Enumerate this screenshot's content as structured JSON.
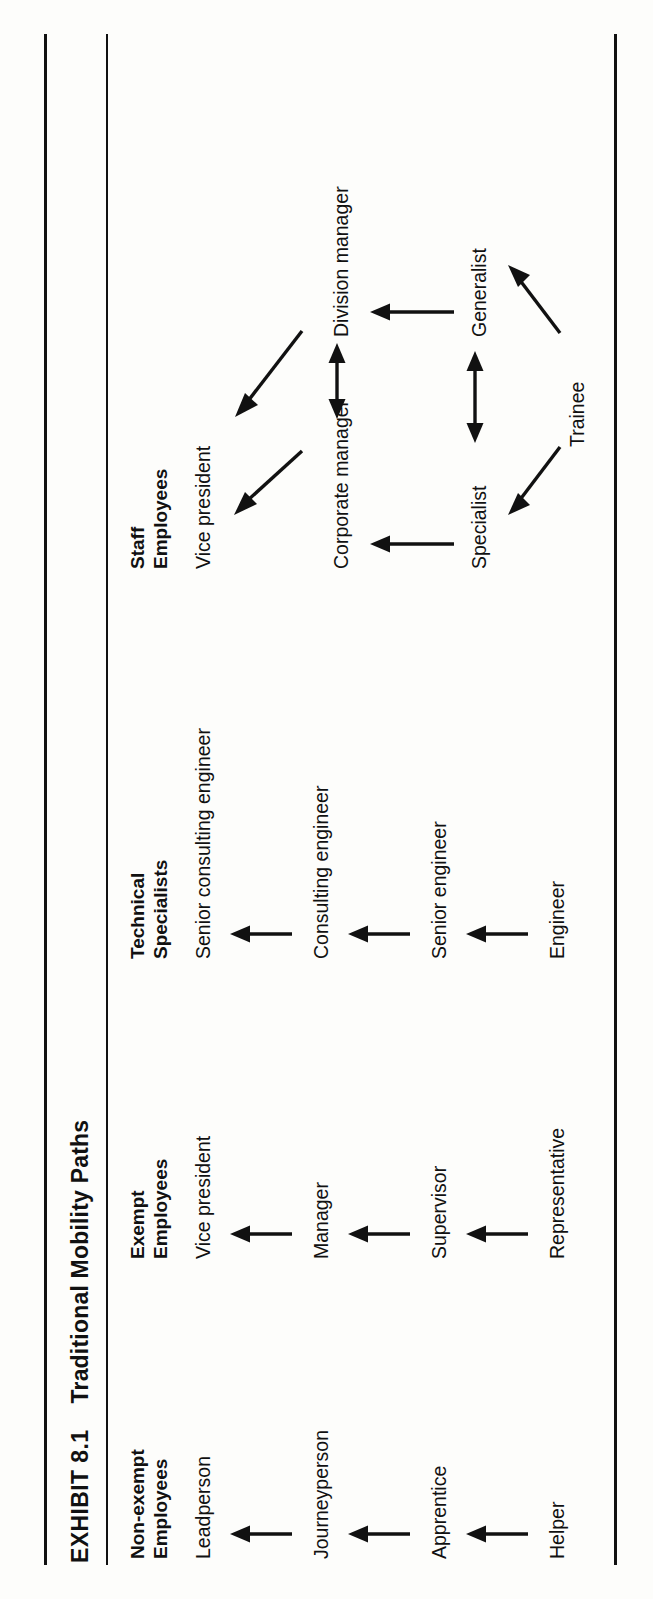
{
  "exhibit": {
    "number_label": "EXHIBIT 8.1",
    "title": "Traditional Mobility Paths"
  },
  "columns": [
    {
      "id": "nonexempt",
      "header": "Non-exempt\nEmployees",
      "levels": {
        "l4": "Leadperson",
        "l3": "Journeyperson",
        "l2": "Apprentice",
        "l1": "Helper"
      }
    },
    {
      "id": "exempt",
      "header": "Exempt\nEmployees",
      "levels": {
        "l4": "Vice president",
        "l3": "Manager",
        "l2": "Supervisor",
        "l1": "Representative"
      }
    },
    {
      "id": "technical",
      "header": "Technical\nSpecialists",
      "levels": {
        "l4": "Senior consulting engineer",
        "l3": "Consulting engineer",
        "l2": "Senior engineer",
        "l1": "Engineer"
      }
    },
    {
      "id": "staff",
      "header": "Staff\nEmployees",
      "nodes": {
        "vice_president": "Vice president",
        "corporate_manager": "Corporate manager",
        "division_manager": "Division manager",
        "specialist": "Specialist",
        "generalist": "Generalist",
        "trainee": "Trainee"
      }
    }
  ],
  "colors": {
    "ink": "#111111",
    "paper": "#fdfdfb",
    "rule": "#111111"
  }
}
